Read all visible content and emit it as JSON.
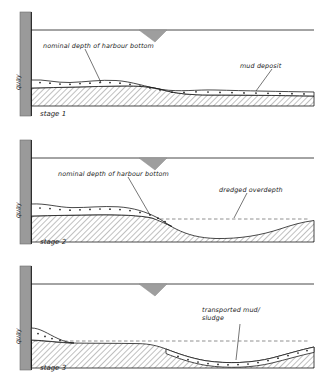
{
  "figure": {
    "type": "cross-section-diagram",
    "panel_count": 3
  },
  "panels": [
    {
      "id": "stage-1",
      "stage_label": "stage 1",
      "quay_label": "quay",
      "labels": [
        {
          "name": "nominal-depth",
          "text": "nominal depth of harbour bottom"
        },
        {
          "name": "mud-deposit",
          "text": "mud deposit"
        }
      ],
      "features": [
        "water-line",
        "ship-hull",
        "quay-wall",
        "mud-layer",
        "harbour-bottom-hatched"
      ]
    },
    {
      "id": "stage-2",
      "stage_label": "stage 2",
      "quay_label": "quay",
      "labels": [
        {
          "name": "nominal-depth",
          "text": "nominal depth of harbour bottom"
        },
        {
          "name": "dredged-overdepth",
          "text": "dredged overdepth"
        }
      ],
      "features": [
        "water-line",
        "ship-hull",
        "quay-wall",
        "mud-layer",
        "dredged-trench",
        "overdepth-dashed-line"
      ]
    },
    {
      "id": "stage-3",
      "stage_label": "stage 3",
      "quay_label": "quay",
      "labels": [
        {
          "name": "transported-mud-sludge",
          "text": "transported mud/ sludge"
        }
      ],
      "features": [
        "water-line",
        "ship-hull",
        "quay-wall",
        "residual-mud-wedge",
        "dredged-trench",
        "settled-mud-layer",
        "overdepth-dashed-line"
      ]
    }
  ],
  "colors": {
    "ink": "#1a1a1a",
    "quay_fill": "#9a9a9a",
    "hatch": "#4a4a4a",
    "mud_fill": "#ffffff",
    "ship_fill": "#9e9e9e",
    "dashed": "#555555"
  }
}
